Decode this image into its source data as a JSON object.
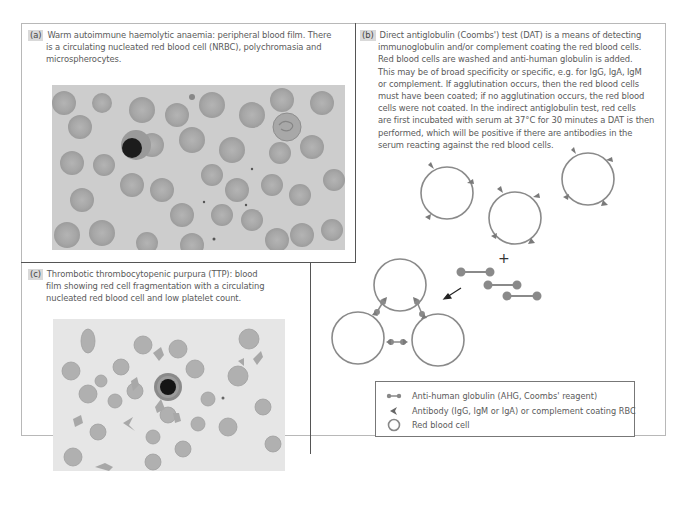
{
  "figure": {
    "panels": [
      {
        "id": "a",
        "label": "(a)",
        "caption_lines": [
          "Warm autoimmune haemolytic anaemia: peripheral blood film. There",
          "is a circulating nucleated red blood cell (NRBC), polychromasia and",
          "microspherocytes."
        ],
        "image_description": "Peripheral blood film micrograph showing red cells and one nucleated red blood cell"
      },
      {
        "id": "b",
        "label": "(b)",
        "caption_lines": [
          "Direct antiglobulin (Coombs') test (DAT) is a means of detecting",
          "immunoglobulin and/or complement coating the red blood cells.",
          "Red blood cells are washed and anti-human globulin is added.",
          "This may be of broad specificity or specific, e.g. for IgG, IgA, IgM",
          "or complement. If agglutination occurs, then the red blood cells",
          "must have been coated; if no agglutination occurs, the red blood",
          "cells were not coated. In the indirect antiglobulin test, red cells",
          "are first incubated with serum at 37°C for 30 minutes a DAT is then",
          "performed, which will be positive if there are antibodies in the",
          "serum reacting against the red blood cells."
        ],
        "diagram": {
          "plus_symbol": "+",
          "legend": [
            {
              "icon": "ahg-dumbbell-icon",
              "text": "Anti-human globulin (AHG, Coombs' reagent)"
            },
            {
              "icon": "antibody-arrowhead-icon",
              "text": "Antibody (IgG, IgM or IgA) or complement coating RBC"
            },
            {
              "icon": "red-cell-circle-icon",
              "text": "Red blood cell"
            }
          ]
        }
      },
      {
        "id": "c",
        "label": "(c)",
        "caption_lines": [
          "Thrombotic thrombocytopenic purpura (TTP): blood",
          "film showing red cell fragmentation with a circulating",
          "nucleated red blood cell and low platelet count."
        ],
        "image_description": "Blood film micrograph showing fragmented red cells and one nucleated red blood cell"
      }
    ],
    "colors": {
      "cell_outline": "#8a8a8a",
      "antibody": "#7a7a7a",
      "ahg": "#808080",
      "caption_text": "#5a5a5a",
      "label_bg": "#d9d9d9"
    }
  }
}
